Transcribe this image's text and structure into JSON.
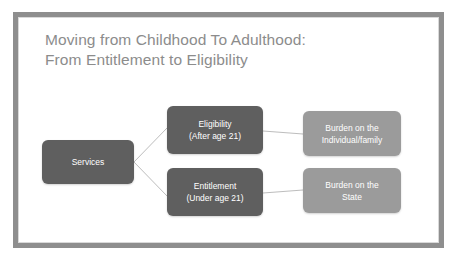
{
  "slide": {
    "title": "Moving from Childhood To Adulthood:\nFrom Entitlement to Eligibility",
    "title_color": "#8c8c8c",
    "frame_color": "#8e8e8e",
    "background_color": "#ffffff"
  },
  "diagram": {
    "connector_color": "#bdbdbd",
    "node_dark_color": "#5f5f5f",
    "node_light_color": "#9b9b9b",
    "nodes": [
      {
        "id": "services",
        "line1": "Services",
        "line2": "",
        "style": "dark"
      },
      {
        "id": "eligibility",
        "line1": "Eligibility",
        "line2": "(After age 21)",
        "style": "dark"
      },
      {
        "id": "entitlement",
        "line1": "Entitlement",
        "line2": "(Under age 21)",
        "style": "dark"
      },
      {
        "id": "burden-individual",
        "line1": "Burden on the",
        "line2": "Individual/family",
        "style": "light"
      },
      {
        "id": "burden-state",
        "line1": "Burden on the",
        "line2": "State",
        "style": "light"
      }
    ],
    "edges": [
      {
        "from": "services",
        "to": "eligibility"
      },
      {
        "from": "services",
        "to": "entitlement"
      },
      {
        "from": "eligibility",
        "to": "burden-individual"
      },
      {
        "from": "entitlement",
        "to": "burden-state"
      }
    ]
  }
}
